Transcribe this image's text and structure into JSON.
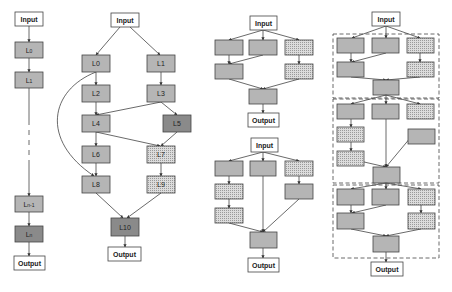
{
  "colors": {
    "plain": "#b5b5b5",
    "dark": "#8a8a8a",
    "dotted_bg": "#d8d8d8",
    "stroke": "#444444",
    "io_fill": "#ffffff"
  },
  "diagrams": [
    {
      "name": "plain-chain",
      "input_label": "Input",
      "output_label": "Output",
      "nodes": [
        {
          "label": "L0",
          "sub": "0"
        },
        {
          "label": "L1",
          "sub": "1"
        },
        {
          "label": "Ln-1",
          "sub": "n-1"
        },
        {
          "label": "Ln",
          "sub": "n"
        }
      ]
    },
    {
      "name": "multi-branch-network",
      "input_label": "Input",
      "output_label": "Output",
      "nodes": [
        {
          "label": "L0"
        },
        {
          "label": "L1"
        },
        {
          "label": "L2"
        },
        {
          "label": "L3"
        },
        {
          "label": "L4"
        },
        {
          "label": "L5"
        },
        {
          "label": "L6"
        },
        {
          "label": "L7"
        },
        {
          "label": "L8"
        },
        {
          "label": "L9"
        },
        {
          "label": "L10"
        }
      ]
    },
    {
      "name": "cell-a",
      "input_label": "Input",
      "output_label": "Output"
    },
    {
      "name": "cell-b",
      "input_label": "Input",
      "output_label": "Output"
    },
    {
      "name": "stacked-cells",
      "input_label": "Input",
      "output_label": "Output"
    }
  ]
}
